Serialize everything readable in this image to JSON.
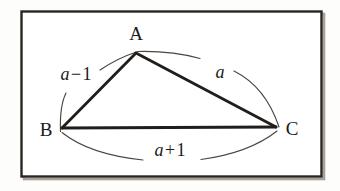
{
  "figure": {
    "kind": "geometry-diagram",
    "background_color": "#fdfdfb",
    "ink_color": "#1c1a18",
    "border": {
      "color": "#2a2522",
      "shadow_color": "#9a938c",
      "x": 21,
      "y": 11,
      "width": 300,
      "height": 165
    },
    "vertices": [
      {
        "id": "A",
        "label": "A",
        "x": 136,
        "y": 53,
        "label_x": 136,
        "label_y": 40
      },
      {
        "id": "B",
        "label": "B",
        "x": 62,
        "y": 128,
        "label_x": 46,
        "label_y": 136
      },
      {
        "id": "C",
        "label": "C",
        "x": 276,
        "y": 127,
        "label_x": 292,
        "label_y": 135
      }
    ],
    "sides": [
      {
        "id": "AB",
        "from": "B",
        "to": "A",
        "label_text": "a",
        "label_operator": "−",
        "label_operand": "1",
        "label_full": "a−1",
        "label_x": 76,
        "label_y": 80
      },
      {
        "id": "AC",
        "from": "A",
        "to": "C",
        "label_text": "a",
        "label_operator": "",
        "label_operand": "",
        "label_full": "a",
        "label_x": 220,
        "label_y": 78
      },
      {
        "id": "BC",
        "from": "B",
        "to": "C",
        "label_text": "a",
        "label_operator": "+",
        "label_operand": "1",
        "label_full": "a+1",
        "label_x": 170,
        "label_y": 156
      }
    ],
    "arcs": {
      "ab": {
        "start_x": 60,
        "start_y": 131,
        "ctrl_x": 66,
        "ctrl_y": 83,
        "end_x": 136,
        "end_y": 52,
        "gap_label": "a−1"
      },
      "ac": {
        "start_x": 137,
        "start_y": 51,
        "ctrl_x": 222,
        "ctrl_y": 58,
        "end_x": 279,
        "end_y": 128,
        "gap_label": "a"
      },
      "bc": {
        "start_x": 62,
        "start_y": 132,
        "ctrl_x": 169,
        "ctrl_y": 168,
        "end_x": 277,
        "end_y": 131,
        "gap_label": "a+1"
      }
    }
  }
}
